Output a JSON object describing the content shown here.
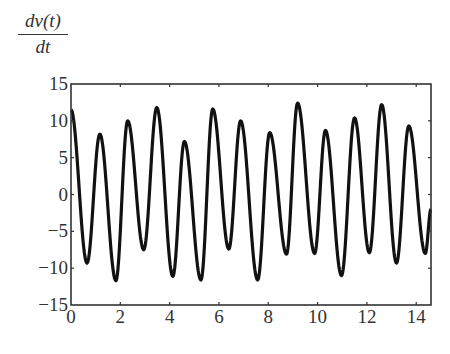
{
  "chart_data": {
    "type": "line",
    "title": "",
    "xlabel": "",
    "ylabel": "dv(t)/dt",
    "ylabel_numerator": "dv(t)",
    "ylabel_denominator": "dt",
    "xlim": [
      0,
      14.6
    ],
    "ylim": [
      -15,
      15
    ],
    "xticks": [
      0,
      2,
      4,
      6,
      8,
      10,
      12,
      14
    ],
    "yticks": [
      15,
      10,
      5,
      0,
      -5,
      -10,
      -15
    ],
    "ytick_labels": [
      "15",
      "10",
      "5",
      "0",
      "−5",
      "−10",
      "−15"
    ],
    "grid": false,
    "legend": null,
    "line_color": "#111111",
    "series": [
      {
        "name": "dv(t)/dt",
        "x": [
          0,
          0.65,
          1.17,
          1.82,
          2.3,
          2.95,
          3.48,
          4.13,
          4.6,
          5.27,
          5.75,
          6.4,
          6.88,
          7.57,
          8.06,
          8.74,
          9.19,
          9.88,
          10.32,
          10.97,
          11.5,
          12.1,
          12.6,
          13.2,
          13.7,
          14.37,
          14.6
        ],
        "y": [
          11.5,
          -9.3,
          8.2,
          -11.7,
          10.0,
          -7.5,
          11.8,
          -11.1,
          7.2,
          -11.6,
          11.6,
          -7.4,
          10.0,
          -11.6,
          8.4,
          -8.1,
          12.4,
          -8.0,
          8.7,
          -11.0,
          10.4,
          -7.9,
          12.2,
          -9.3,
          9.3,
          -8.0,
          -2.0
        ]
      }
    ]
  }
}
